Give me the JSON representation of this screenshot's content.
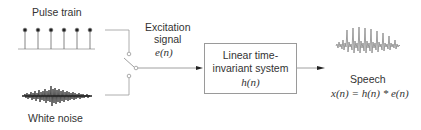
{
  "diagram": {
    "sources": {
      "pulse_train": {
        "label": "Pulse train",
        "pulse_count": 6
      },
      "white_noise": {
        "label": "White noise"
      }
    },
    "switch": {
      "label_line1": "Excitation",
      "label_line2": "signal",
      "symbol": "e(n)"
    },
    "system_block": {
      "line1": "Linear time-",
      "line2": "invariant system",
      "symbol": "h(n)"
    },
    "output": {
      "label": "Speech",
      "equation": "x(n) = h(n) * e(n)"
    },
    "colors": {
      "line": "#8a8a8a",
      "stem": "#555555",
      "pulse_dot": "#222222",
      "noise": "#222222",
      "speech": "#777777",
      "text": "#333333"
    }
  }
}
